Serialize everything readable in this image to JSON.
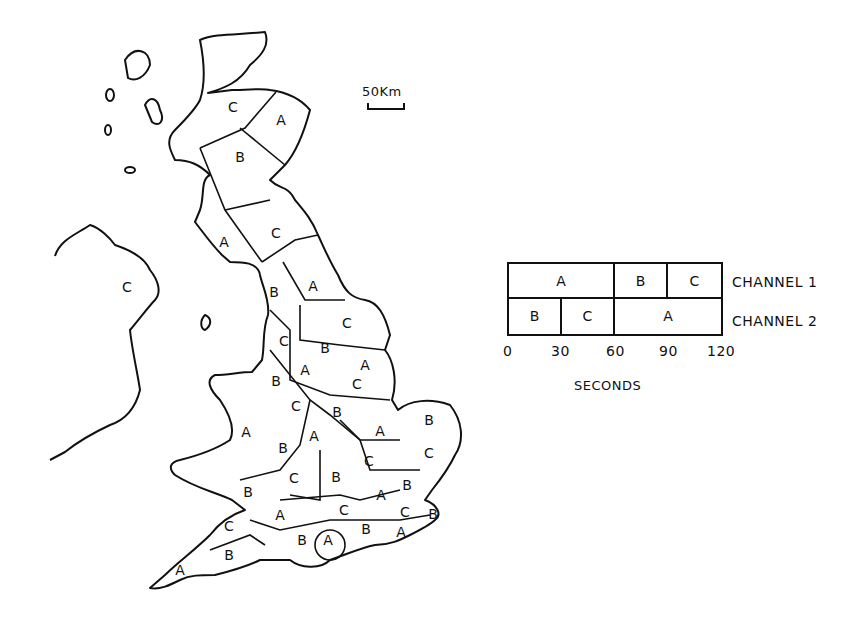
{
  "scale_bar": {
    "label": "50Km"
  },
  "map": {
    "regions": [
      {
        "label": "C",
        "x": 233,
        "y": 108
      },
      {
        "label": "A",
        "x": 281,
        "y": 121
      },
      {
        "label": "B",
        "x": 240,
        "y": 158
      },
      {
        "label": "A",
        "x": 224,
        "y": 243
      },
      {
        "label": "C",
        "x": 276,
        "y": 234
      },
      {
        "label": "C",
        "x": 127,
        "y": 288
      },
      {
        "label": "B",
        "x": 274,
        "y": 293
      },
      {
        "label": "A",
        "x": 313,
        "y": 287
      },
      {
        "label": "C",
        "x": 347,
        "y": 324
      },
      {
        "label": "C",
        "x": 284,
        "y": 342
      },
      {
        "label": "B",
        "x": 325,
        "y": 349
      },
      {
        "label": "A",
        "x": 365,
        "y": 366
      },
      {
        "label": "A",
        "x": 305,
        "y": 371
      },
      {
        "label": "B",
        "x": 276,
        "y": 382
      },
      {
        "label": "C",
        "x": 357,
        "y": 385
      },
      {
        "label": "C",
        "x": 296,
        "y": 407
      },
      {
        "label": "B",
        "x": 337,
        "y": 413
      },
      {
        "label": "B",
        "x": 429,
        "y": 421
      },
      {
        "label": "A",
        "x": 246,
        "y": 433
      },
      {
        "label": "A",
        "x": 314,
        "y": 437
      },
      {
        "label": "A",
        "x": 380,
        "y": 432
      },
      {
        "label": "B",
        "x": 283,
        "y": 449
      },
      {
        "label": "C",
        "x": 429,
        "y": 454
      },
      {
        "label": "C",
        "x": 369,
        "y": 462
      },
      {
        "label": "B",
        "x": 336,
        "y": 478
      },
      {
        "label": "C",
        "x": 294,
        "y": 479
      },
      {
        "label": "B",
        "x": 248,
        "y": 493
      },
      {
        "label": "B",
        "x": 407,
        "y": 486
      },
      {
        "label": "A",
        "x": 381,
        "y": 496
      },
      {
        "label": "A",
        "x": 280,
        "y": 516
      },
      {
        "label": "C",
        "x": 344,
        "y": 511
      },
      {
        "label": "C",
        "x": 405,
        "y": 513
      },
      {
        "label": "B",
        "x": 433,
        "y": 515
      },
      {
        "label": "C",
        "x": 229,
        "y": 527
      },
      {
        "label": "B",
        "x": 366,
        "y": 530
      },
      {
        "label": "A",
        "x": 401,
        "y": 533
      },
      {
        "label": "B",
        "x": 302,
        "y": 541
      },
      {
        "label": "A",
        "x": 328,
        "y": 541
      },
      {
        "label": "B",
        "x": 229,
        "y": 556
      },
      {
        "label": "A",
        "x": 180,
        "y": 571
      }
    ]
  },
  "chart_data": {
    "type": "table",
    "xlabel": "SECONDS",
    "x_ticks": [
      "0",
      "30",
      "60",
      "90",
      "120"
    ],
    "xlim": [
      0,
      120
    ],
    "series": [
      {
        "name": "CHANNEL 1",
        "segments": [
          {
            "label": "A",
            "start": 0,
            "end": 60
          },
          {
            "label": "B",
            "start": 60,
            "end": 90
          },
          {
            "label": "C",
            "start": 90,
            "end": 120
          }
        ]
      },
      {
        "name": "CHANNEL 2",
        "segments": [
          {
            "label": "B",
            "start": 0,
            "end": 30
          },
          {
            "label": "C",
            "start": 30,
            "end": 60
          },
          {
            "label": "A",
            "start": 60,
            "end": 120
          }
        ]
      }
    ]
  },
  "legend": {
    "channel1": "CHANNEL 1",
    "channel2": "CHANNEL 2",
    "ch1": {
      "a": "A",
      "b": "B",
      "c": "C"
    },
    "ch2": {
      "b": "B",
      "c": "C",
      "a": "A"
    },
    "ticks": {
      "t0": "0",
      "t30": "30",
      "t60": "60",
      "t90": "90",
      "t120": "120"
    },
    "axis_label": "SECONDS"
  }
}
